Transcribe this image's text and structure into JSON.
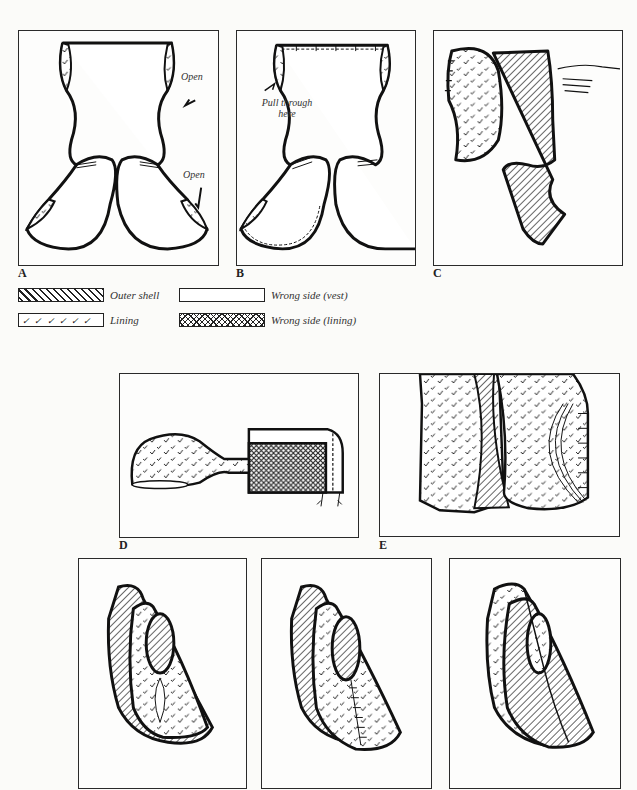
{
  "page": {
    "header_text": "",
    "page_number": ""
  },
  "figures": {
    "A": {
      "label": "A",
      "annotations": [
        "Open",
        "Open"
      ]
    },
    "B": {
      "label": "B",
      "annotations": [
        "Pull through here"
      ]
    },
    "C": {
      "label": "C"
    },
    "D": {
      "label": "D"
    },
    "E": {
      "label": "E"
    },
    "F": {
      "label": ""
    },
    "G": {
      "label": ""
    },
    "H": {
      "label": ""
    }
  },
  "legend": {
    "items": [
      {
        "pattern": "diagonal-hatch",
        "label": "Outer shell"
      },
      {
        "pattern": "blank",
        "label": "Wrong side (vest)"
      },
      {
        "pattern": "tick-marks",
        "label": "Lining"
      },
      {
        "pattern": "cross-hatch",
        "label": "Wrong side (lining)"
      }
    ]
  },
  "colors": {
    "ink": "#1a1a1a",
    "paper": "#fbfbf9"
  }
}
